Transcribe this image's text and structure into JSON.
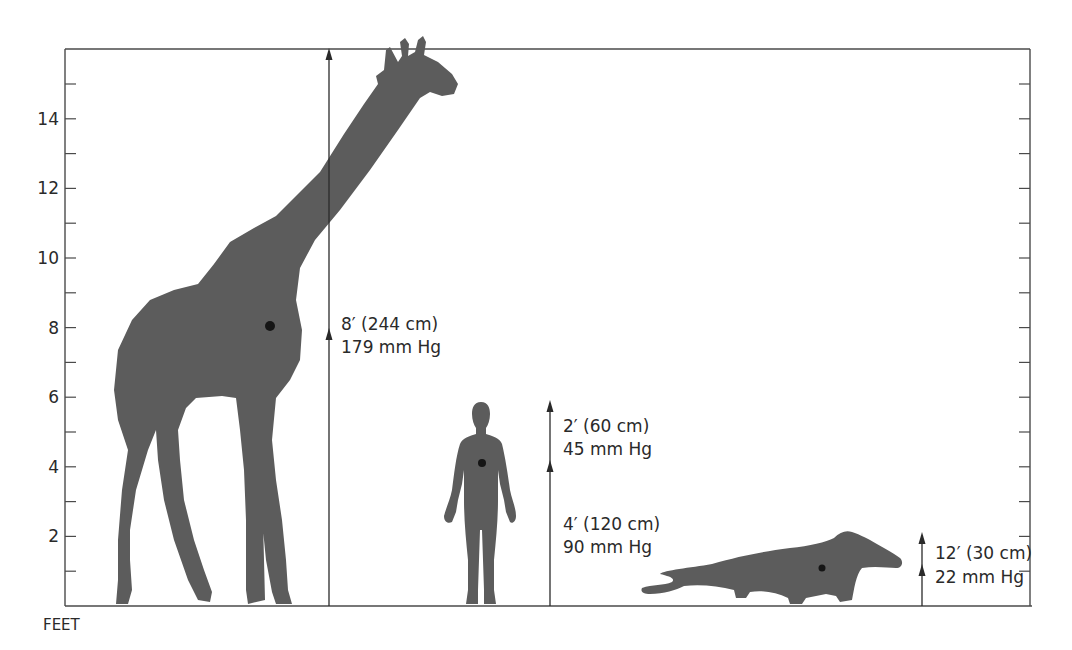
{
  "figure": {
    "axis_unit_label": "FEET",
    "y_axis": {
      "min": 0,
      "max": 16,
      "major_ticks": [
        2,
        4,
        6,
        8,
        10,
        12,
        14
      ],
      "major_tick_labels": [
        "2",
        "4",
        "6",
        "8",
        "10",
        "12",
        "14"
      ],
      "minor_ticks": [
        1,
        3,
        5,
        7,
        9,
        11,
        13,
        15
      ]
    },
    "colors": {
      "silhouette": "#5c5c5c",
      "heart_marker": "#151515",
      "line": "#2a2a2a"
    },
    "animals": [
      {
        "name": "giraffe",
        "height_ft": 16,
        "heart_height_ft": 8,
        "annotations": [
          {
            "segment": "heart-to-head",
            "from_ft": 8,
            "to_ft": 16,
            "line1": "8′ (244 cm)",
            "line2": "179 mm Hg"
          }
        ]
      },
      {
        "name": "human",
        "height_ft": 6,
        "heart_height_ft": 4,
        "annotations": [
          {
            "segment": "heart-to-head",
            "from_ft": 4,
            "to_ft": 6,
            "line1": "2′ (60 cm)",
            "line2": "45 mm Hg"
          },
          {
            "segment": "ground-to-heart",
            "from_ft": 0,
            "to_ft": 4,
            "line1": "4′ (120 cm)",
            "line2": "90 mm Hg"
          }
        ]
      },
      {
        "name": "reptile",
        "height_ft": 1.2,
        "heart_height_ft": 1.1,
        "annotations": [
          {
            "segment": "heart-height",
            "from_ft": 0,
            "to_ft": 2,
            "line1": "12′ (30 cm)",
            "line2": "22 mm Hg"
          }
        ]
      }
    ]
  }
}
